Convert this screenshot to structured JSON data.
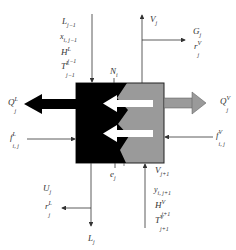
{
  "diagram": {
    "type": "equilibrium stage schematic",
    "colors": {
      "liquid_phase": "#000000",
      "vapor_phase": "#9a9a9a",
      "line": "#333333",
      "background": "#ffffff"
    },
    "labels": {
      "L_in": {
        "base": "L",
        "sub": "j−1"
      },
      "x_in": {
        "base": "x",
        "sub": "i, j−1"
      },
      "H_L_in": {
        "base": "H",
        "sup": "L",
        "sub": "j−1"
      },
      "T_L_in": {
        "base": "T",
        "sup": "L",
        "sub": "j−1"
      },
      "V_out": {
        "base": "V",
        "sub": "j"
      },
      "G": {
        "base": "G",
        "sub": "j"
      },
      "r_V": {
        "base": "r",
        "sup": "V",
        "sub": "j"
      },
      "N": {
        "base": "N",
        "sub": "i"
      },
      "Q_L": {
        "base": "Q",
        "sup": "L",
        "sub": "j"
      },
      "Q_V": {
        "base": "Q",
        "sup": "V",
        "sub": "j"
      },
      "f_L": {
        "base": "f",
        "sup": "L",
        "sub": "i, j"
      },
      "f_V": {
        "base": "f",
        "sup": "V",
        "sub": "i, j"
      },
      "e": {
        "base": "e",
        "sub": "j"
      },
      "V_in": {
        "base": "V",
        "sub": "j+1"
      },
      "y_in": {
        "base": "y",
        "sub": "i, j+1"
      },
      "H_V_in": {
        "base": "H",
        "sup": "V",
        "sub": "j+1"
      },
      "T_V_in": {
        "base": "T",
        "sup": "V",
        "sub": "j+1"
      },
      "U": {
        "base": "U",
        "sub": "j"
      },
      "r_L": {
        "base": "r",
        "sup": "L",
        "sub": "j"
      },
      "L_out": {
        "base": "L",
        "sub": "j"
      }
    }
  }
}
